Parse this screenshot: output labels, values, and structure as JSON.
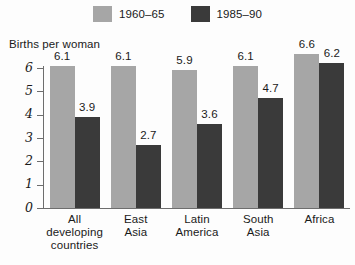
{
  "chart_data": {
    "type": "bar",
    "title": "",
    "ylabel": "Births per woman",
    "xlabel": "",
    "ylim": [
      0,
      6
    ],
    "yticks": [
      "0",
      "1",
      "2",
      "3",
      "4",
      "5",
      "6"
    ],
    "grid": false,
    "legend_position": "top-center",
    "categories": [
      "All\ndeveloping\ncountries",
      "East\nAsia",
      "Latin\nAmerica",
      "South\nAsia",
      "Africa"
    ],
    "category_lines": [
      [
        "All",
        "developing",
        "countries"
      ],
      [
        "East",
        "Asia"
      ],
      [
        "Latin",
        "America"
      ],
      [
        "South",
        "Asia"
      ],
      [
        "Africa"
      ]
    ],
    "series": [
      {
        "name": "1960–65",
        "color": "#a6a6a6",
        "values": [
          6.1,
          6.1,
          5.9,
          6.1,
          6.6
        ],
        "labels": [
          "6.1",
          "6.1",
          "5.9",
          "6.1",
          "6.6"
        ]
      },
      {
        "name": "1985–90",
        "color": "#3a3a3a",
        "values": [
          3.9,
          2.7,
          3.6,
          4.7,
          6.2
        ],
        "labels": [
          "3.9",
          "2.7",
          "3.6",
          "4.7",
          "6.2"
        ]
      }
    ]
  },
  "legend": {
    "entries": [
      {
        "label": "1960–65",
        "color": "#a6a6a6",
        "swatch": "legend-swatch-light"
      },
      {
        "label": "1985–90",
        "color": "#3a3a3a",
        "swatch": "legend-swatch-dark"
      }
    ]
  },
  "axis": {
    "y_title": "Births per woman",
    "ticks": [
      "6",
      "5",
      "4",
      "3",
      "2",
      "1",
      "0"
    ]
  },
  "colors": {
    "series_1960_65": "#a6a6a6",
    "series_1985_90": "#3a3a3a",
    "axis": "#6d6d6d",
    "text": "#1a1a1a",
    "background": "#fdfdfd"
  }
}
